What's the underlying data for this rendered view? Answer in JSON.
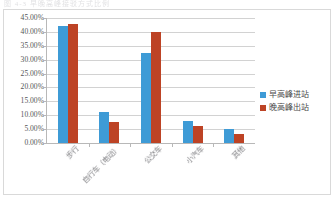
{
  "scan_header_text": "图 4-3 早晚高峰接驳方式比例",
  "chart_data": {
    "type": "bar",
    "title": "",
    "xlabel": "",
    "ylabel": "",
    "categories": [
      "步行",
      "自行车（电动）",
      "公交车",
      "小汽车",
      "其他"
    ],
    "series": [
      {
        "name": "早高峰进站",
        "color": "#3E9BD6",
        "values": [
          42.0,
          11.0,
          32.5,
          8.0,
          5.0
        ]
      },
      {
        "name": "晚高峰出站",
        "color": "#BD4325",
        "values": [
          42.8,
          7.5,
          40.0,
          6.0,
          3.3
        ]
      }
    ],
    "ylim": [
      0,
      45
    ],
    "ytick_step": 5,
    "ytick_labels": [
      "45.00%",
      "40.00%",
      "35.00%",
      "30.00%",
      "25.00%",
      "20.00%",
      "15.00%",
      "10.00%",
      "5.00%",
      "0.00%"
    ],
    "grid": true,
    "legend_position": "right"
  }
}
